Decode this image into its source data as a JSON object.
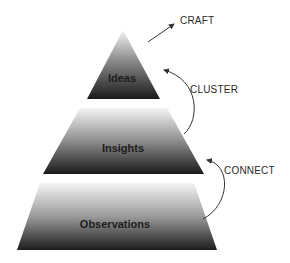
{
  "diagram": {
    "type": "pyramid",
    "tiers": [
      {
        "label": "Ideas",
        "level": "top"
      },
      {
        "label": "Insights",
        "level": "middle"
      },
      {
        "label": "Observations",
        "level": "bottom"
      }
    ],
    "transitions": [
      {
        "label": "CRAFT",
        "from": "Ideas",
        "to": "outside"
      },
      {
        "label": "CLUSTER",
        "from": "Insights",
        "to": "Ideas"
      },
      {
        "label": "CONNECT",
        "from": "Observations",
        "to": "Insights"
      }
    ],
    "colors": {
      "gradient_top": "#f2f2f2",
      "gradient_bottom": "#1a1a1a",
      "arrow": "#333333"
    }
  }
}
